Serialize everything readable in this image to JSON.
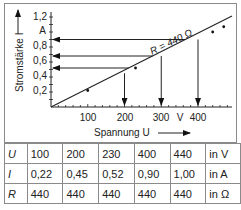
{
  "chart_data": {
    "type": "line",
    "title": "",
    "xlabel": "Spannung U",
    "ylabel": "Stromstärke I",
    "x_unit": "V",
    "y_unit": "A",
    "xlim": [
      0,
      480
    ],
    "ylim": [
      0,
      1.2
    ],
    "x_ticks": [
      "100",
      "200",
      "300",
      "V",
      "400"
    ],
    "y_ticks": [
      "0,2",
      "0,4",
      "0,6",
      "0,8",
      "A",
      "1,2"
    ],
    "annotation": "R = 440 Ω",
    "series": [
      {
        "name": "R = 440 Ω",
        "x": [
          0,
          100,
          200,
          230,
          300,
          400,
          440
        ],
        "y": [
          0,
          0.22,
          0.45,
          0.52,
          0.68,
          0.9,
          1.0
        ]
      }
    ],
    "drop_lines": [
      {
        "from": "x",
        "x": 200,
        "y": 0.45
      },
      {
        "from": "x",
        "x": 300,
        "y": 0.68
      },
      {
        "from": "x",
        "x": 400,
        "y": 0.9
      }
    ],
    "read_lines": [
      {
        "from": "line",
        "y": 0.9
      },
      {
        "from": "line",
        "y": 0.68
      },
      {
        "from": "line",
        "y": 0.52
      }
    ]
  },
  "table": {
    "rows": [
      {
        "symbol": "U",
        "values": [
          "100",
          "200",
          "230",
          "400",
          "440"
        ],
        "unit": "in V"
      },
      {
        "symbol": "I",
        "values": [
          "0,22",
          "0,45",
          "0,52",
          "0,90",
          "1,00"
        ],
        "unit": "in A"
      },
      {
        "symbol": "R",
        "values": [
          "440",
          "440",
          "440",
          "440",
          "440"
        ],
        "unit": "in Ω"
      }
    ]
  }
}
